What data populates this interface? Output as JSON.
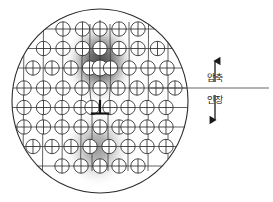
{
  "figure": {
    "background_color": "#ffffff",
    "line_color": "#1a1a1a"
  },
  "grain": {
    "name": "circular-grain-boundary",
    "center_x": 100,
    "center_y": 101,
    "radius_x": 88,
    "radius_y": 92,
    "stroke_color": "#2b2b2b"
  },
  "lattice": {
    "atom_symbol": "circle-with-cross",
    "atom_radius": 7.2,
    "row_spacing": 19.5,
    "col_spacing": 19.5,
    "rows": 9,
    "cols": 9,
    "bond_color": "#3a3a3a",
    "atom_fill": "#ffffff"
  },
  "dislocation": {
    "name": "edge-dislocation",
    "symbol": "⊥",
    "x": 100,
    "y": 110,
    "extra_half_plane_col": 4,
    "description": "extra half plane terminating above slip plane"
  },
  "strain_fields": [
    {
      "name": "compression-zone",
      "region": "above-slip-plane",
      "cx": 100,
      "cy": 62,
      "rx": 34,
      "ry": 40,
      "intensity": "dark",
      "color": "#4a4a4a"
    },
    {
      "name": "tension-zone",
      "region": "below-slip-plane",
      "cx": 97,
      "cy": 148,
      "rx": 33,
      "ry": 38,
      "intensity": "light",
      "color": "#8a8a8a"
    }
  ],
  "slip_plane_line": {
    "name": "slip-plane-reference-line",
    "x_start": 12,
    "x_end": 268,
    "y": 88
  },
  "annotations": {
    "compression": {
      "label": "압축",
      "meaning_icon": "arrow-up-icon",
      "arrow_direction": "up"
    },
    "tension": {
      "label": "인장",
      "meaning_icon": "arrow-down-icon",
      "arrow_direction": "down"
    }
  }
}
